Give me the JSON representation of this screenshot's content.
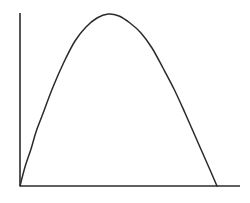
{
  "figure": {
    "background_color": "#ffffff",
    "line_color": "#2b2b2b",
    "width_px": 250,
    "height_px": 203
  },
  "chart_data": {
    "type": "line",
    "title": "",
    "subtitle": "",
    "xlabel": "",
    "ylabel": "",
    "legend": [],
    "legend_position": "none",
    "grid": false,
    "tick_labels_x": [],
    "tick_labels_y": [],
    "annotations": [],
    "xlim": [
      0,
      1
    ],
    "ylim": [
      0,
      1
    ],
    "axes": {
      "x_axis_drawn": true,
      "y_axis_drawn": true,
      "x_axis_from_px": [
        20,
        186
      ],
      "x_axis_to_px": [
        240,
        186
      ],
      "y_axis_from_px": [
        20,
        13
      ],
      "y_axis_to_px": [
        20,
        186
      ],
      "ticks": "none",
      "spines": [
        "left",
        "bottom"
      ]
    },
    "series": [
      {
        "name": "curve",
        "description": "downward-opening parabolic arch rising from the origin, peaking left of centre, then descending to the baseline",
        "x": [
          0.0,
          0.025,
          0.05,
          0.075,
          0.1,
          0.15,
          0.2,
          0.25,
          0.3,
          0.35,
          0.4,
          0.45,
          0.5,
          0.55,
          0.6,
          0.65,
          0.7,
          0.75,
          0.8,
          0.85,
          0.895
        ],
        "y": [
          0.0,
          0.111,
          0.216,
          0.315,
          0.408,
          0.577,
          0.722,
          0.843,
          0.928,
          0.978,
          1.0,
          0.988,
          0.95,
          0.888,
          0.8,
          0.688,
          0.562,
          0.424,
          0.28,
          0.134,
          0.0
        ],
        "points_px": [
          [
            20,
            186
          ],
          [
            25,
            167
          ],
          [
            31,
            149
          ],
          [
            36,
            132
          ],
          [
            42,
            116
          ],
          [
            53,
            87
          ],
          [
            64,
            62
          ],
          [
            75,
            41
          ],
          [
            86,
            27
          ],
          [
            97,
            18
          ],
          [
            108,
            14
          ],
          [
            119,
            16
          ],
          [
            130,
            23
          ],
          [
            141,
            33
          ],
          [
            152,
            48
          ],
          [
            163,
            68
          ],
          [
            174,
            89
          ],
          [
            185,
            113
          ],
          [
            196,
            138
          ],
          [
            207,
            163
          ],
          [
            217,
            186
          ]
        ],
        "color": "#2b2b2b",
        "style": "solid",
        "width_px": 1.5,
        "markers": "none"
      }
    ]
  }
}
